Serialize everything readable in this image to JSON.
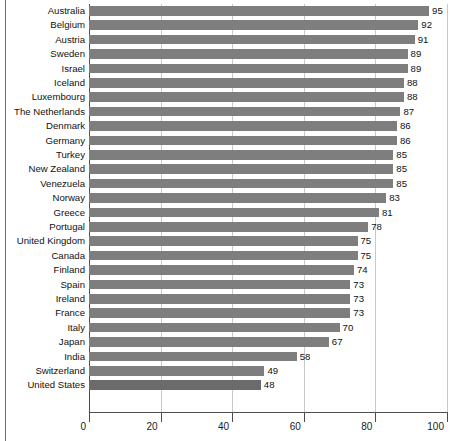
{
  "chart_data": {
    "type": "bar",
    "orientation": "horizontal",
    "title": "",
    "subtitle": "",
    "xlabel": "",
    "ylabel": "",
    "xlim": [
      0,
      100
    ],
    "xticks": [
      0,
      20,
      40,
      60,
      80,
      100
    ],
    "xtick_labels": [
      "0",
      "20",
      "40",
      "60",
      "80",
      "100"
    ],
    "grid": "vertical",
    "legend": "none",
    "bar_color": "#7e7e7e",
    "highlight_color": "#6b6b6b",
    "categories": [
      "Australia",
      "Belgium",
      "Austria",
      "Sweden",
      "Israel",
      "Iceland",
      "Luxembourg",
      "The Netherlands",
      "Denmark",
      "Germany",
      "Turkey",
      "New Zealand",
      "Venezuela",
      "Norway",
      "Greece",
      "Portugal",
      "United Kingdom",
      "Canada",
      "Finland",
      "Spain",
      "Ireland",
      "France",
      "Italy",
      "Japan",
      "India",
      "Switzerland",
      "United States"
    ],
    "values": [
      95,
      92,
      91,
      89,
      89,
      88,
      88,
      87,
      86,
      86,
      85,
      85,
      85,
      83,
      81,
      78,
      75,
      75,
      74,
      73,
      73,
      73,
      70,
      67,
      58,
      49,
      48
    ],
    "value_labels": [
      "95",
      "92",
      "91",
      "89",
      "89",
      "88",
      "88",
      "87",
      "86",
      "86",
      "85",
      "85",
      "85",
      "83",
      "81",
      "78",
      "75",
      "75",
      "74",
      "73",
      "73",
      "73",
      "70",
      "67",
      "58",
      "49",
      "48"
    ]
  }
}
